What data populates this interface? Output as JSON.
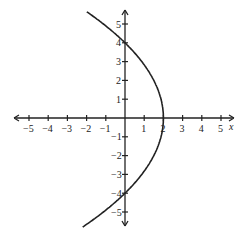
{
  "chart_data": {
    "type": "line",
    "title": "",
    "xlabel": "x",
    "ylabel": "",
    "xlim": [
      -5.5,
      5.5
    ],
    "ylim": [
      -5.5,
      5.5
    ],
    "grid": false,
    "legend": null,
    "x_ticks": [
      -5,
      -4,
      -3,
      -2,
      -1,
      1,
      2,
      3,
      4,
      5
    ],
    "y_ticks": [
      -5,
      -4,
      -3,
      -2,
      -1,
      1,
      2,
      3,
      4,
      5
    ],
    "series": [
      {
        "name": "parabola x = 2 - y^2/8",
        "points": [
          {
            "x": -1.9,
            "y": 5.6
          },
          {
            "x": 0,
            "y": 4
          },
          {
            "x": 1.5,
            "y": 2
          },
          {
            "x": 2,
            "y": 0
          },
          {
            "x": 1.5,
            "y": -2
          },
          {
            "x": 0,
            "y": -4
          },
          {
            "x": -2.1,
            "y": -5.8
          }
        ]
      }
    ],
    "color": "#222222"
  }
}
